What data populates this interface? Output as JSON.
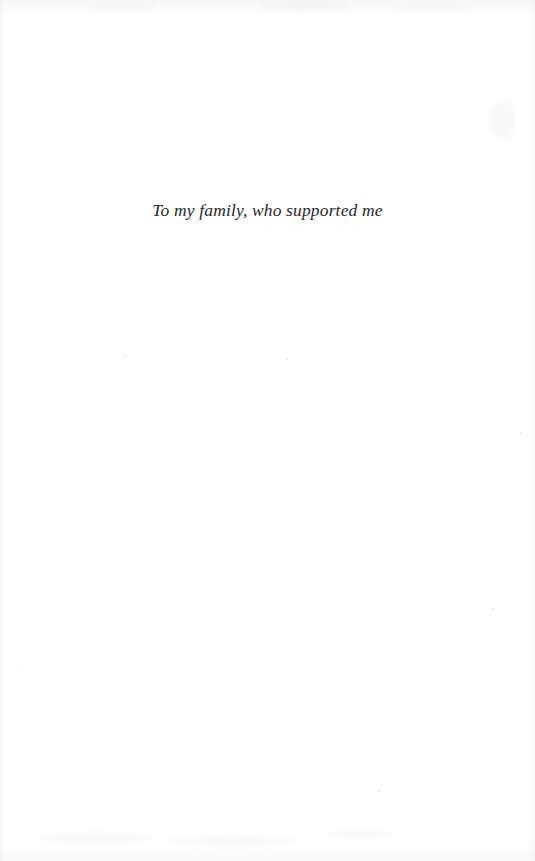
{
  "page": {
    "kind": "book-dedication-page",
    "background_color": "#ffffff",
    "width": 535,
    "height": 861
  },
  "dedication": {
    "text": "To my family, who supported me",
    "style": "italic-serif",
    "alignment": "center",
    "text_color": "#28272a"
  },
  "artifacts": {
    "description": "faint scanner edge shading and paper speckles",
    "speck_color": "#787880",
    "edge_shadow_color": "#9b9ba0"
  }
}
